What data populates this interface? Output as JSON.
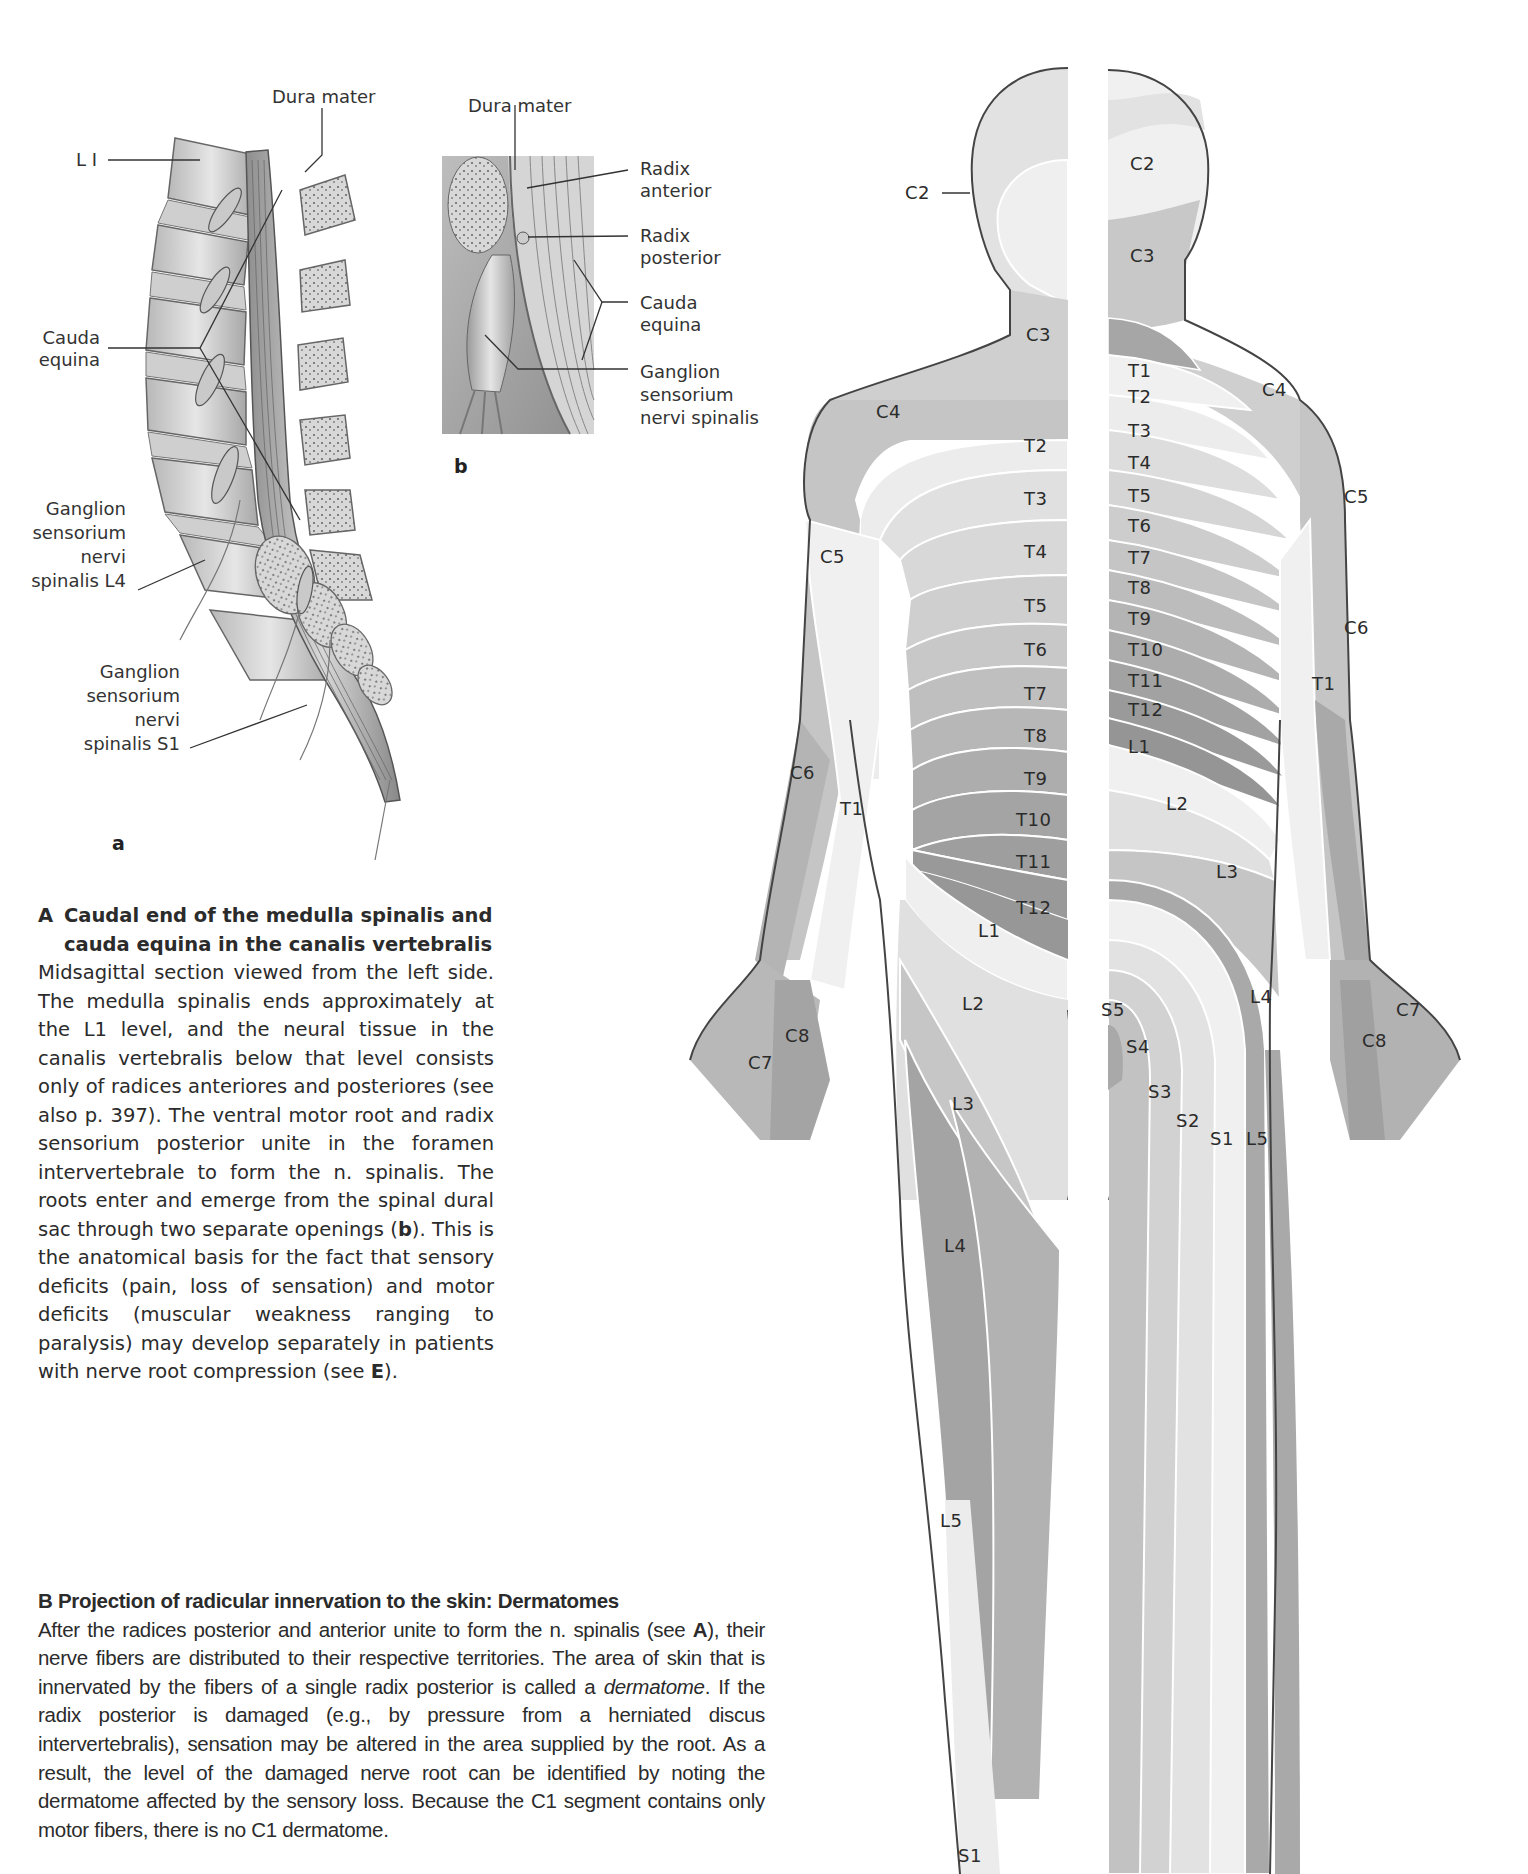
{
  "figure_A": {
    "letter_a": "a",
    "letter_b": "b",
    "panel_a_labels": {
      "dura_mater": "Dura mater",
      "l1": "L I",
      "cauda_equina_1": "Cauda",
      "cauda_equina_2": "equina",
      "ganglion_l4_1": "Ganglion",
      "ganglion_l4_2": "sensorium",
      "ganglion_l4_3": "nervi",
      "ganglion_l4_4": "spinalis L4",
      "ganglion_s1_1": "Ganglion",
      "ganglion_s1_2": "sensorium",
      "ganglion_s1_3": "nervi",
      "ganglion_s1_4": "spinalis S1"
    },
    "panel_b_labels": {
      "dura_mater": "Dura mater",
      "radix_anterior_1": "Radix",
      "radix_anterior_2": "anterior",
      "radix_posterior_1": "Radix",
      "radix_posterior_2": "posterior",
      "cauda_equina_1": "Cauda",
      "cauda_equina_2": "equina",
      "ganglion_1": "Ganglion",
      "ganglion_2": "sensorium",
      "ganglion_3": "nervi spinalis"
    }
  },
  "caption_A": {
    "letter": "A",
    "title_line1": "Caudal end of the medulla spinalis and",
    "title_line2": "cauda equina in the canalis vertebralis",
    "body_1": "Midsagittal section viewed from the left side. The medulla spinalis ends approximately at the L1 level, and the neural tissue in the canalis vertebralis below that level consists only of radices anteriores and posteriores (see also p. 397). The ventral motor root and radix sensorium posterior unite in the foramen intervertebrale to form the n. spinalis. The roots enter and emerge from the spinal dural sac through two separate openings (",
    "body_bold_b": "b",
    "body_2": "). This is the anatomical basis for the fact that sensory deficits (pain, loss of sensation) and motor deficits (muscular weakness ranging to paralysis) may develop separately in patients with nerve root compression (see ",
    "body_bold_e": "E",
    "body_3": ")."
  },
  "caption_B": {
    "title": "B  Projection of radicular innervation to the skin: Dermatomes",
    "body_1": "After the radices posterior and anterior unite to form the n. spinalis (see ",
    "body_bold_a": "A",
    "body_2": "), their nerve fibers are distributed to their respective territories. The area of skin that is innervated by the fibers of a single radix posterior is called a ",
    "body_italic": "dermatome",
    "body_3": ". If the radix posterior is damaged (e.g., by pressure from a herniated discus intervertebralis), sensation may be altered in the area supplied by the root. As a result, the level of the damaged nerve root can be identified by noting the dermatome affected by the sensory loss. Because the C1 segment contains only motor fibers, there is no C1 dermatome."
  },
  "dermatome_figure": {
    "colors": {
      "lightest": "#f2f2f2",
      "light": "#e2e2e2",
      "mid_light": "#d0d0d0",
      "mid": "#bdbdbd",
      "mid_dark": "#a9a9a9",
      "dark": "#979797",
      "outline": "#444444",
      "boundary": "#ffffff"
    },
    "front_labels": {
      "c2_pointer": "C2",
      "c3": "C3",
      "c4": "C4",
      "c5": "C5",
      "c6": "C6",
      "c7": "C7",
      "c8": "C8",
      "t1_arm": "T1",
      "t2": "T2",
      "t3": "T3",
      "t4": "T4",
      "t5": "T5",
      "t6": "T6",
      "t7": "T7",
      "t8": "T8",
      "t9": "T9",
      "t10": "T10",
      "t11": "T11",
      "t12": "T12",
      "l1": "L1",
      "l2": "L2",
      "l3": "L3",
      "l4": "L4",
      "l5": "L5",
      "s1": "S1"
    },
    "back_labels": {
      "c2": "C2",
      "c3": "C3",
      "c4": "C4",
      "c5": "C5",
      "c6": "C6",
      "c7": "C7",
      "c8": "C8",
      "t1_arm": "T1",
      "t1": "T1",
      "t2": "T2",
      "t3": "T3",
      "t4": "T4",
      "t5": "T5",
      "t6": "T6",
      "t7": "T7",
      "t8": "T8",
      "t9": "T9",
      "t10": "T10",
      "t11": "T11",
      "t12": "T12",
      "l1": "L1",
      "l2": "L2",
      "l3": "L3",
      "l4": "L4",
      "l5": "L5",
      "s1": "S1",
      "s2": "S2",
      "s3": "S3",
      "s4": "S4",
      "s5": "S5"
    }
  }
}
